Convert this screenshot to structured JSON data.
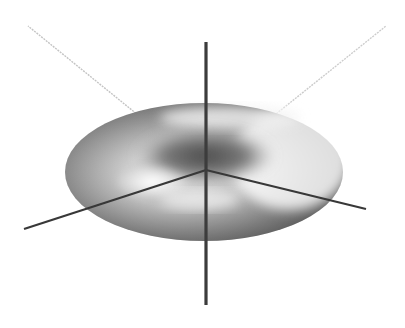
{
  "figure": {
    "object": "torus",
    "colors": {
      "background": "#ffffff",
      "torus_light": "#ffffff",
      "torus_mid": "#b8b8b8",
      "torus_dark": "#5a5a5a",
      "axis_dark": "#3a3a3a",
      "axis_light": "#c8c8c8"
    },
    "axes": [
      {
        "name": "vertical-axis",
        "from": [
          206,
          42
        ],
        "to": [
          206,
          305
        ],
        "style": "dark"
      },
      {
        "name": "front-left-axis",
        "from": [
          206,
          170
        ],
        "to": [
          24,
          229
        ],
        "style": "dark"
      },
      {
        "name": "front-right-axis",
        "from": [
          206,
          170
        ],
        "to": [
          366,
          209
        ],
        "style": "dark"
      },
      {
        "name": "back-left-axis",
        "from": [
          206,
          170
        ],
        "to": [
          28,
          26
        ],
        "style": "light"
      },
      {
        "name": "back-right-axis",
        "from": [
          206,
          170
        ],
        "to": [
          386,
          26
        ],
        "style": "light"
      }
    ],
    "torus": {
      "center": [
        204,
        172
      ],
      "outer_rx": 139,
      "outer_ry": 69,
      "hole_center": [
        205,
        160
      ],
      "hole_rx": 62,
      "hole_ry": 22
    }
  }
}
